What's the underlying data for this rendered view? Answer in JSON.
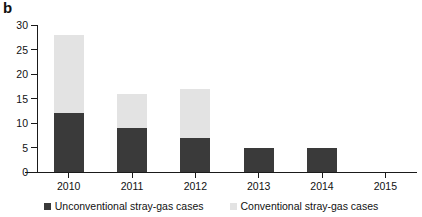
{
  "panel": {
    "label": "b"
  },
  "chart_data": {
    "type": "bar",
    "title": "",
    "subtitle": "",
    "xlabel": "",
    "ylabel": "",
    "stacked": true,
    "grid": false,
    "legend_position": "bottom",
    "categories": [
      "2010",
      "2011",
      "2012",
      "2013",
      "2014",
      "2015"
    ],
    "ylim": [
      0,
      30
    ],
    "yticks": [
      0,
      5,
      10,
      15,
      20,
      25,
      30
    ],
    "ytick_labels": [
      "0",
      "5",
      "10",
      "15",
      "20",
      "25",
      "30"
    ],
    "series": [
      {
        "name": "Unconventional stray-gas cases",
        "color": "#3a3a3a",
        "values": [
          12,
          9,
          7,
          5,
          5,
          0
        ]
      },
      {
        "name": "Conventional stray-gas cases",
        "color": "#e3e3e3",
        "values": [
          16,
          7,
          10,
          0,
          0,
          0
        ]
      }
    ],
    "totals": [
      28,
      16,
      17,
      5,
      5,
      0
    ]
  },
  "legend": {
    "items": [
      {
        "label": "Unconventional stray-gas cases",
        "swatch": "unconventional"
      },
      {
        "label": "Conventional stray-gas cases",
        "swatch": "conventional"
      }
    ]
  },
  "colors": {
    "unconventional": "#3a3a3a",
    "conventional": "#e3e3e3",
    "axis": "#1a1a1a",
    "background": "#ffffff"
  }
}
